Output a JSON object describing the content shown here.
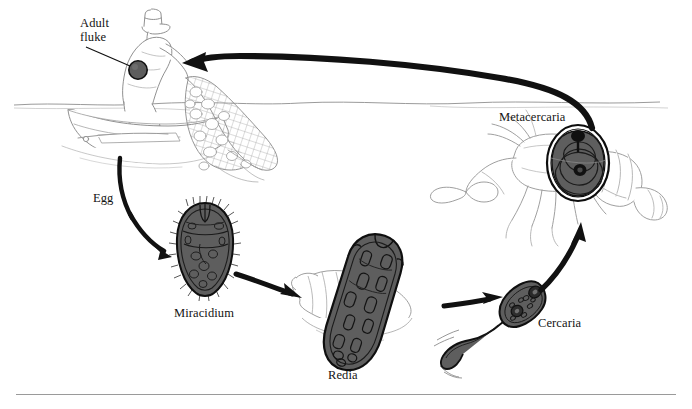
{
  "figure": {
    "width": 692,
    "height": 409,
    "background_color": "#ffffff",
    "ink_color": "#111111",
    "organism_fill": "#5a5a5a",
    "line_art_color": "#8a8a8a",
    "rule_color": "#9a9a9a"
  },
  "labels": {
    "adult_fluke_line1": "Adult",
    "adult_fluke_line2": "fluke",
    "egg": "Egg",
    "miracidium": "Miracidium",
    "redia": "Redia",
    "cercaria": "Cercaria",
    "metacercaria": "Metacercaria"
  },
  "stages": [
    {
      "name": "adult-fluke",
      "label": "Adult fluke",
      "host": "human fisherman",
      "x": 138,
      "y": 70
    },
    {
      "name": "egg",
      "label": "Egg",
      "host": "water",
      "x": 103,
      "y": 197
    },
    {
      "name": "miracidium",
      "label": "Miracidium",
      "host": "free-swimming",
      "x": 205,
      "y": 255
    },
    {
      "name": "redia",
      "label": "Redia",
      "host": "snail",
      "x": 362,
      "y": 300
    },
    {
      "name": "cercaria",
      "label": "Cercaria",
      "host": "free-swimming",
      "x": 523,
      "y": 300
    },
    {
      "name": "metacercaria",
      "label": "Metacercaria",
      "host": "crayfish",
      "x": 578,
      "y": 163
    }
  ],
  "arrows": [
    {
      "name": "crayfish-to-human",
      "from": "metacercaria",
      "to": "adult-fluke",
      "style": "large curved"
    },
    {
      "name": "human-to-egg",
      "from": "adult-fluke",
      "to": "egg",
      "style": "curved"
    },
    {
      "name": "egg-to-miracidium",
      "from": "egg",
      "to": "miracidium",
      "style": "curved"
    },
    {
      "name": "miracidium-to-redia",
      "from": "miracidium",
      "to": "redia",
      "style": "straight"
    },
    {
      "name": "redia-to-cercaria",
      "from": "redia",
      "to": "cercaria",
      "style": "straight"
    },
    {
      "name": "cercaria-to-metacercaria",
      "from": "cercaria",
      "to": "metacercaria",
      "style": "curved"
    }
  ],
  "scene": {
    "human_figure": "fisherman hauling net from boat",
    "boat": "small rowboat on water",
    "waterline": "horizontal wavy water surface",
    "snail": "spiral snail shell",
    "crayfish": "crayfish with claws and tail"
  }
}
